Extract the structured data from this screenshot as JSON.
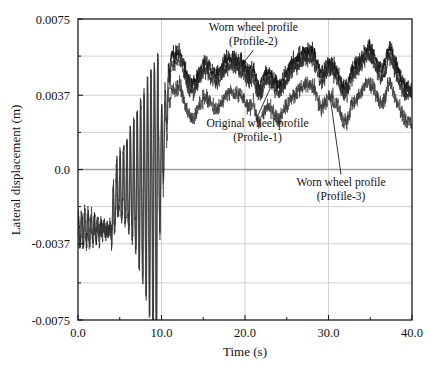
{
  "chart_data": {
    "type": "line",
    "title": "",
    "xlabel": "Time (s)",
    "ylabel": "Lateral displacement (m)",
    "xlim": [
      0.0,
      40.0
    ],
    "ylim": [
      -0.0075,
      0.0075
    ],
    "xticks": [
      0.0,
      10.0,
      20.0,
      30.0,
      40.0
    ],
    "xtick_labels": [
      "0.0",
      "10.0",
      "20.0",
      "30.0",
      "40.0"
    ],
    "xminor_ticks": [
      5.0,
      15.0,
      25.0,
      35.0
    ],
    "yticks": [
      -0.0075,
      -0.0037,
      0.0,
      0.0037,
      0.0075
    ],
    "ytick_labels": [
      "-0.0075",
      "-0.0037",
      "0.0",
      "0.0037",
      "0.0075"
    ],
    "yminor_ticks": [
      -0.00565,
      -0.00185,
      0.00185,
      0.00565
    ],
    "grid": true,
    "grid_color": "#cccccc",
    "zero_line": true,
    "zero_line_color": "#9a9a9a",
    "frame_color": "#1a1a1a",
    "legend_position": "inline-annotations",
    "series": [
      {
        "name": "Worn wheel profile (Profile-2)",
        "color": "#111111",
        "band": "upper",
        "steady_mean": 0.005,
        "noise_amplitude": 0.00035,
        "description": "Top trace; settles highest after hunting transient"
      },
      {
        "name": "Original wheel profile (Profile-1)",
        "color": "#2a2a2a",
        "band": "middle",
        "steady_mean": 0.0046,
        "noise_amplitude": 0.00032,
        "description": "Middle trace; close beneath Profile-2"
      },
      {
        "name": "Worn wheel profile (Profile-3)",
        "color": "#3a3a3a",
        "band": "lower",
        "steady_mean": 0.0033,
        "noise_amplitude": 0.00035,
        "description": "Lower separated trace"
      }
    ],
    "phases": [
      {
        "name": "initial-small-oscillation",
        "t_start": 0.0,
        "t_end": 4.0,
        "center": -0.003,
        "amplitude": 0.0009
      },
      {
        "name": "growing-hunting-oscillation",
        "t_start": 4.0,
        "t_end": 9.6,
        "center": -0.001,
        "amplitude_start": 0.0012,
        "amplitude_end": 0.0075
      },
      {
        "name": "steady-state-separated-bands",
        "t_start": 9.8,
        "t_end": 40.0,
        "description": "Three noisy bands with slow wander and step features near t=12, 21, 28, 32, 37"
      }
    ],
    "annotations": [
      {
        "id": "annot-profile-2",
        "line1": "Worn wheel profile",
        "line2": "(Profile-2)",
        "text_x": 21.0,
        "text_y": 0.0069,
        "leader_to_x": 19.6,
        "leader_to_y": 0.0052,
        "arrow": true
      },
      {
        "id": "annot-profile-1",
        "line1": "Original wheel profile",
        "line2": "(Profile-1)",
        "text_x": 21.5,
        "text_y": 0.0021,
        "leader_to_x": 23.4,
        "leader_to_y": 0.0044,
        "arrow": false
      },
      {
        "id": "annot-profile-3",
        "line1": "Worn wheel profile",
        "line2": "(Profile-3)",
        "text_x": 31.5,
        "text_y": -0.0008,
        "leader_to_x": 30.2,
        "leader_to_y": 0.0036,
        "arrow": false
      }
    ]
  }
}
